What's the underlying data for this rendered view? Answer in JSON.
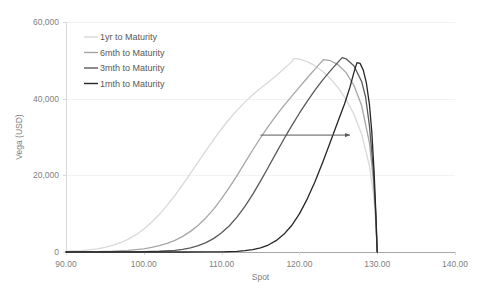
{
  "chart_data": {
    "type": "line",
    "title": "",
    "xlabel": "Spot",
    "ylabel": "Vega (USD)",
    "xlim": [
      90,
      140
    ],
    "ylim": [
      0,
      60000
    ],
    "xticks": [
      90,
      100,
      110,
      120,
      130,
      140
    ],
    "xtick_labels": [
      "90.00",
      "100.00",
      "110.00",
      "120.00",
      "130.00",
      "140.00"
    ],
    "yticks": [
      0,
      20000,
      40000,
      60000
    ],
    "ytick_labels": [
      "0",
      "20,000",
      "40,000",
      "60,000"
    ],
    "grid": true,
    "legend_position": "top-left",
    "annotations": [
      {
        "name": "time-decay-arrow",
        "type": "arrow",
        "x_start": 115.0,
        "x_end": 126.5,
        "y": 30500,
        "direction": "right",
        "label": ""
      }
    ],
    "barrier_level": 130.0,
    "series": [
      {
        "name": "1yr to Maturity",
        "color": "#d9d9d9",
        "width": 1.3,
        "peak_x": 119.3,
        "peak_y": 50500,
        "points": [
          [
            90.0,
            180
          ],
          [
            91.0,
            260
          ],
          [
            92.0,
            380
          ],
          [
            93.0,
            560
          ],
          [
            94.0,
            820
          ],
          [
            95.0,
            1200
          ],
          [
            96.0,
            1720
          ],
          [
            97.0,
            2420
          ],
          [
            98.0,
            3350
          ],
          [
            99.0,
            4520
          ],
          [
            100.0,
            5980
          ],
          [
            101.0,
            7740
          ],
          [
            102.0,
            9800
          ],
          [
            103.0,
            12150
          ],
          [
            104.0,
            14750
          ],
          [
            105.0,
            17550
          ],
          [
            106.0,
            20500
          ],
          [
            107.0,
            23500
          ],
          [
            108.0,
            26500
          ],
          [
            109.0,
            29400
          ],
          [
            110.0,
            32150
          ],
          [
            111.0,
            34700
          ],
          [
            112.0,
            37000
          ],
          [
            113.0,
            39100
          ],
          [
            114.0,
            41000
          ],
          [
            115.0,
            42700
          ],
          [
            116.0,
            44300
          ],
          [
            117.0,
            46000
          ],
          [
            118.0,
            47800
          ],
          [
            119.0,
            49600
          ],
          [
            119.3,
            50500
          ],
          [
            120.0,
            50300
          ],
          [
            121.0,
            49650
          ],
          [
            122.0,
            48600
          ],
          [
            123.0,
            47100
          ],
          [
            124.0,
            45200
          ],
          [
            125.0,
            42800
          ],
          [
            126.0,
            39800
          ],
          [
            127.0,
            36000
          ],
          [
            128.0,
            30800
          ],
          [
            129.0,
            22500
          ],
          [
            129.5,
            15500
          ],
          [
            129.8,
            8000
          ],
          [
            130.0,
            0
          ]
        ]
      },
      {
        "name": "6mth to Maturity",
        "color": "#a6a6a6",
        "width": 1.3,
        "peak_x": 123.1,
        "peak_y": 50200,
        "points": [
          [
            90.0,
            20
          ],
          [
            92.0,
            45
          ],
          [
            94.0,
            100
          ],
          [
            96.0,
            210
          ],
          [
            98.0,
            430
          ],
          [
            100.0,
            840
          ],
          [
            101.0,
            1180
          ],
          [
            102.0,
            1640
          ],
          [
            103.0,
            2250
          ],
          [
            104.0,
            3050
          ],
          [
            105.0,
            4080
          ],
          [
            106.0,
            5380
          ],
          [
            107.0,
            7000
          ],
          [
            108.0,
            8950
          ],
          [
            109.0,
            11250
          ],
          [
            110.0,
            13900
          ],
          [
            111.0,
            16850
          ],
          [
            112.0,
            20000
          ],
          [
            113.0,
            23300
          ],
          [
            114.0,
            26600
          ],
          [
            115.0,
            29800
          ],
          [
            116.0,
            32800
          ],
          [
            117.0,
            35600
          ],
          [
            118.0,
            38200
          ],
          [
            119.0,
            40600
          ],
          [
            120.0,
            43000
          ],
          [
            121.0,
            45400
          ],
          [
            122.0,
            47700
          ],
          [
            123.0,
            50000
          ],
          [
            123.1,
            50200
          ],
          [
            124.0,
            49900
          ],
          [
            125.0,
            48800
          ],
          [
            126.0,
            46800
          ],
          [
            127.0,
            43500
          ],
          [
            128.0,
            38200
          ],
          [
            129.0,
            28500
          ],
          [
            129.5,
            19000
          ],
          [
            129.8,
            9500
          ],
          [
            130.0,
            0
          ]
        ]
      },
      {
        "name": "3mth to Maturity",
        "color": "#595959",
        "width": 1.3,
        "peak_x": 125.5,
        "peak_y": 50700,
        "points": [
          [
            90.0,
            2
          ],
          [
            95.0,
            10
          ],
          [
            98.0,
            35
          ],
          [
            100.0,
            80
          ],
          [
            102.0,
            190
          ],
          [
            104.0,
            450
          ],
          [
            105.0,
            700
          ],
          [
            106.0,
            1080
          ],
          [
            107.0,
            1650
          ],
          [
            108.0,
            2450
          ],
          [
            109.0,
            3550
          ],
          [
            110.0,
            5000
          ],
          [
            111.0,
            6850
          ],
          [
            112.0,
            9150
          ],
          [
            113.0,
            11900
          ],
          [
            114.0,
            15050
          ],
          [
            115.0,
            18500
          ],
          [
            116.0,
            22100
          ],
          [
            117.0,
            25800
          ],
          [
            118.0,
            29400
          ],
          [
            119.0,
            32900
          ],
          [
            120.0,
            36200
          ],
          [
            121.0,
            39300
          ],
          [
            122.0,
            42200
          ],
          [
            123.0,
            44900
          ],
          [
            124.0,
            47300
          ],
          [
            125.0,
            49600
          ],
          [
            125.5,
            50700
          ],
          [
            126.0,
            50400
          ],
          [
            127.0,
            48600
          ],
          [
            128.0,
            44500
          ],
          [
            128.5,
            40500
          ],
          [
            129.0,
            33000
          ],
          [
            129.5,
            21500
          ],
          [
            129.8,
            10500
          ],
          [
            130.0,
            0
          ]
        ]
      },
      {
        "name": "1mth to Maturity",
        "color": "#262626",
        "width": 1.3,
        "peak_x": 127.4,
        "peak_y": 49400,
        "points": [
          [
            90.0,
            0
          ],
          [
            100.0,
            1
          ],
          [
            105.0,
            5
          ],
          [
            108.0,
            20
          ],
          [
            110.0,
            55
          ],
          [
            111.0,
            100
          ],
          [
            112.0,
            185
          ],
          [
            113.0,
            340
          ],
          [
            114.0,
            620
          ],
          [
            115.0,
            1080
          ],
          [
            116.0,
            1820
          ],
          [
            117.0,
            2950
          ],
          [
            118.0,
            4600
          ],
          [
            119.0,
            6900
          ],
          [
            120.0,
            9950
          ],
          [
            121.0,
            13800
          ],
          [
            122.0,
            18300
          ],
          [
            123.0,
            23400
          ],
          [
            124.0,
            28800
          ],
          [
            125.0,
            34300
          ],
          [
            125.8,
            38600
          ],
          [
            126.5,
            43000
          ],
          [
            127.0,
            46800
          ],
          [
            127.4,
            49400
          ],
          [
            127.8,
            49200
          ],
          [
            128.2,
            47500
          ],
          [
            128.6,
            44200
          ],
          [
            129.0,
            38500
          ],
          [
            129.3,
            31500
          ],
          [
            129.6,
            21000
          ],
          [
            129.85,
            9000
          ],
          [
            130.0,
            0
          ]
        ]
      }
    ]
  },
  "legend": {
    "items": [
      {
        "label": "1yr to Maturity",
        "color": "#d9d9d9"
      },
      {
        "label": "6mth to Maturity",
        "color": "#a6a6a6"
      },
      {
        "label": "3mth to Maturity",
        "color": "#595959"
      },
      {
        "label": "1mth to Maturity",
        "color": "#262626"
      }
    ]
  }
}
